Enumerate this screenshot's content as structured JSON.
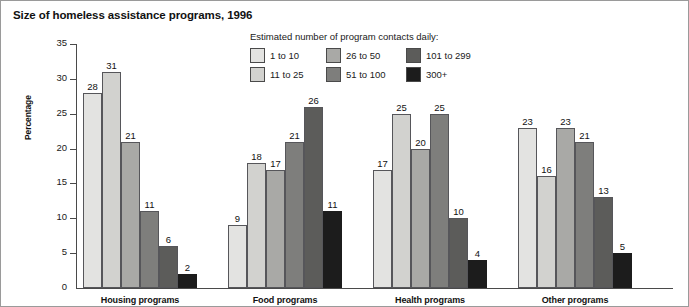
{
  "chart_data": {
    "type": "bar",
    "title": "Size of homeless assistance programs, 1996",
    "xlabel": "",
    "ylabel": "Percentage",
    "ylim": [
      0,
      35
    ],
    "yticks": [
      0,
      5,
      10,
      15,
      20,
      25,
      30,
      35
    ],
    "grid": false,
    "legend_position": "top-center",
    "legend_title": "Estimated number of program contacts daily:",
    "categories": [
      "Housing programs",
      "Food programs",
      "Health programs",
      "Other programs"
    ],
    "series": [
      {
        "name": "1 to 10",
        "color": "#e3e3e1",
        "values": [
          28,
          9,
          17,
          23
        ]
      },
      {
        "name": "11 to 25",
        "color": "#d2d2cf",
        "values": [
          31,
          18,
          25,
          16
        ]
      },
      {
        "name": "26 to 50",
        "color": "#a9a9a6",
        "values": [
          21,
          17,
          20,
          23
        ]
      },
      {
        "name": "51 to 100",
        "color": "#7e7e7c",
        "values": [
          11,
          21,
          25,
          21
        ]
      },
      {
        "name": "101 to 299",
        "color": "#5c5c5a",
        "values": [
          6,
          26,
          10,
          13
        ]
      },
      {
        "name": "300+",
        "color": "#1c1c1c",
        "values": [
          2,
          11,
          4,
          5
        ]
      }
    ]
  }
}
